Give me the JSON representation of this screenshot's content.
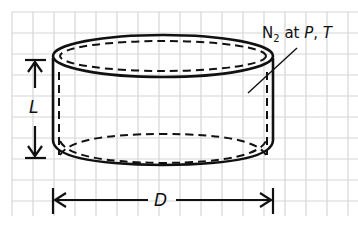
{
  "diagram": {
    "type": "cylinder-container",
    "labels": {
      "length": "L",
      "diameter": "D",
      "gas_prefix": "N",
      "gas_subscript": "2",
      "gas_at": " at ",
      "gas_P": "P",
      "gas_sep": ", ",
      "gas_T": "T"
    },
    "colors": {
      "background": "#ffffff",
      "grid": "#d6d6d6",
      "stroke": "#111111"
    },
    "grid": {
      "origin_x": 12,
      "origin_y": 12,
      "spacing": 21
    }
  }
}
